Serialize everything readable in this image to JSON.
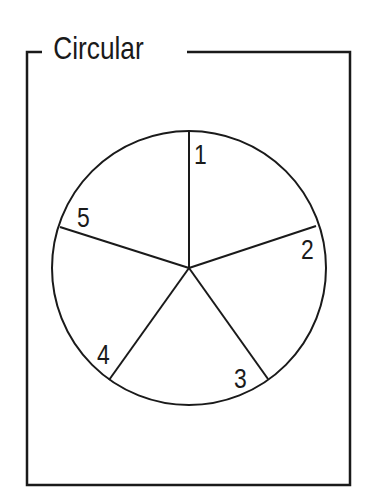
{
  "figure": {
    "title": "Circular",
    "stroke_color": "#1a1a1a",
    "background": "#ffffff"
  },
  "circle": {
    "center": [
      189,
      268
    ],
    "radius": 137,
    "segments": [
      {
        "label": "1"
      },
      {
        "label": "2"
      },
      {
        "label": "3"
      },
      {
        "label": "4"
      },
      {
        "label": "5"
      }
    ]
  }
}
